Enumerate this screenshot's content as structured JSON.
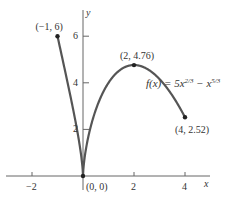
{
  "chart_data": {
    "type": "line",
    "title": "",
    "function_label": "f(x) = 5x^{2/3} − x^{5/3}",
    "function_label_parts": {
      "prefix": "f(x) = 5x",
      "exp1": "2/3",
      "mid": " − x",
      "exp2": "5/3"
    },
    "xlabel": "x",
    "ylabel": "y",
    "xlim": [
      -2.8,
      5.5
    ],
    "ylim": [
      -1.0,
      7.5
    ],
    "x_ticks": [
      -2,
      2,
      4
    ],
    "x_tick_labels": [
      "−2",
      "2",
      "4"
    ],
    "y_ticks": [
      2,
      4,
      6
    ],
    "y_tick_labels": [
      "2",
      "4",
      "6"
    ],
    "grid": false,
    "series": [
      {
        "name": "f(x)",
        "domain": [
          -1,
          4
        ],
        "x": [
          -1,
          0,
          2,
          4
        ],
        "y": [
          6,
          0,
          4.76,
          2.52
        ]
      }
    ],
    "points": [
      {
        "x": -1,
        "y": 6,
        "label": "(−1, 6)"
      },
      {
        "x": 0,
        "y": 0,
        "label": "(0, 0)"
      },
      {
        "x": 2,
        "y": 4.76,
        "label": "(2, 4.76)"
      },
      {
        "x": 4,
        "y": 2.52,
        "label": "(4, 2.52)"
      }
    ],
    "colors": {
      "curve": "#555555",
      "axis": "#666666",
      "text": "#333333"
    }
  }
}
